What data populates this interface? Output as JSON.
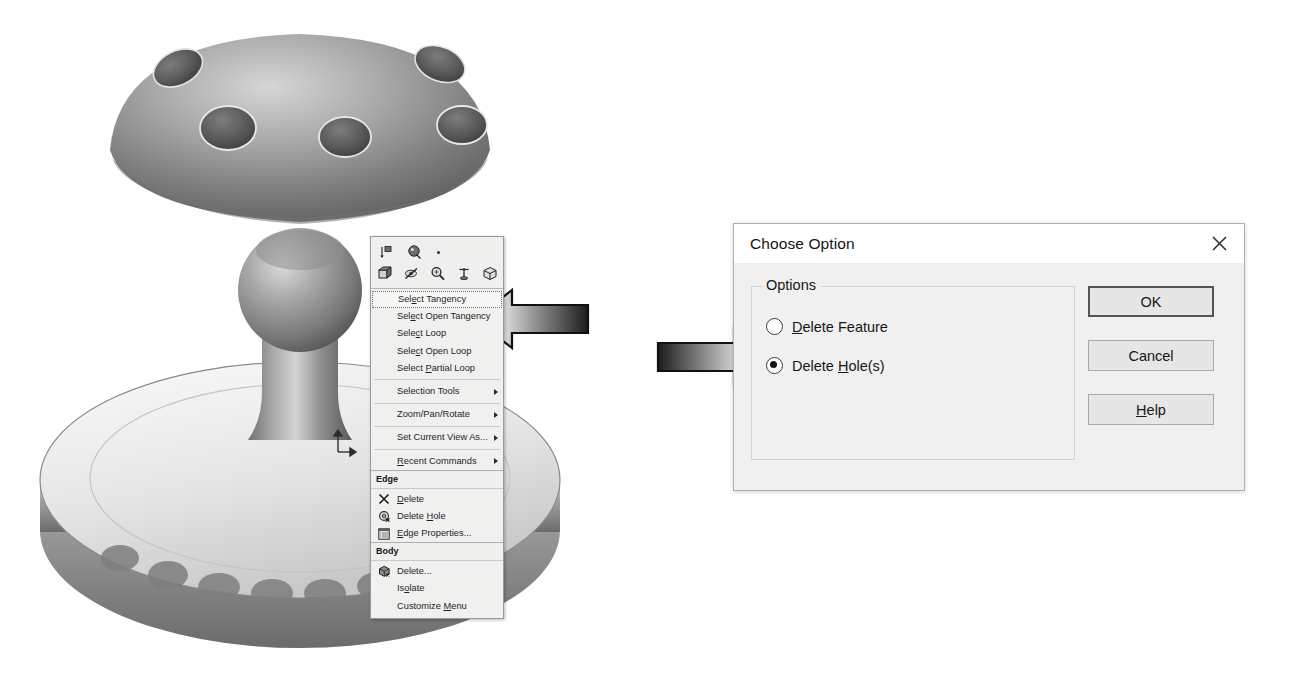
{
  "scene": {
    "description": "CAD shaded 3D model of a metal knob/stand part with circular holes on the top dome and a fluted circular base",
    "origin_marker": "coordinate-triad"
  },
  "context_menu": {
    "toolbar": {
      "row1": [
        {
          "name": "dimension-icon",
          "glyph": "dimension"
        },
        {
          "name": "smart-dimension-icon",
          "glyph": "balloon"
        },
        {
          "name": "more-dot-icon",
          "glyph": "dot"
        }
      ],
      "row2": [
        {
          "name": "face-select-icon",
          "glyph": "faces"
        },
        {
          "name": "hide-show-icon",
          "glyph": "hide"
        },
        {
          "name": "zoom-area-icon",
          "glyph": "magnifier"
        },
        {
          "name": "origin-icon",
          "glyph": "axis"
        },
        {
          "name": "isometric-view-icon",
          "glyph": "cube"
        }
      ]
    },
    "items": [
      {
        "label": "Select Tangency",
        "accel": "e",
        "highlighted": true,
        "submenu": false,
        "icon": null
      },
      {
        "label": "Select Open Tangency",
        "accel": "e",
        "highlighted": false,
        "submenu": false,
        "icon": null
      },
      {
        "label": "Select Loop",
        "accel": "c",
        "highlighted": false,
        "submenu": false,
        "icon": null
      },
      {
        "label": "Select Open Loop",
        "accel": "c",
        "highlighted": false,
        "submenu": false,
        "icon": null
      },
      {
        "label": "Select Partial Loop",
        "accel": "P",
        "highlighted": false,
        "submenu": false,
        "icon": null
      },
      {
        "separator_before": true,
        "label": "Selection Tools",
        "accel": null,
        "highlighted": false,
        "submenu": true,
        "icon": null
      },
      {
        "separator_before": true,
        "label": "Zoom/Pan/Rotate",
        "accel": null,
        "highlighted": false,
        "submenu": true,
        "icon": null
      },
      {
        "separator_before": true,
        "label": "Set Current View As...",
        "accel": null,
        "highlighted": false,
        "submenu": true,
        "icon": null
      },
      {
        "separator_before": true,
        "label": "Recent Commands",
        "accel": "R",
        "highlighted": false,
        "submenu": true,
        "icon": null
      }
    ],
    "edge_group": {
      "header": "Edge",
      "items": [
        {
          "label": "Delete",
          "accel": "D",
          "icon": "delete-x-icon"
        },
        {
          "label": "Delete Hole",
          "accel": "H",
          "icon": "delete-hole-icon"
        },
        {
          "label": "Edge Properties...",
          "accel": "E",
          "icon": "edge-properties-icon"
        }
      ]
    },
    "body_group": {
      "header": "Body",
      "items": [
        {
          "label": "Delete...",
          "accel": null,
          "icon": "delete-body-icon"
        },
        {
          "label": "Isolate",
          "accel": "o",
          "icon": null
        },
        {
          "label": "Customize Menu",
          "accel": "M",
          "icon": null
        }
      ]
    }
  },
  "dialog": {
    "title": "Choose Option",
    "close_label": "✕",
    "group_legend": "Options",
    "radios": [
      {
        "label_before": "",
        "accel": "D",
        "label_after": "elete Feature",
        "checked": false,
        "name": "delete-feature"
      },
      {
        "label_before": "Delete ",
        "accel": "H",
        "label_after": "ole(s)",
        "checked": true,
        "name": "delete-holes"
      }
    ],
    "buttons": [
      {
        "name": "ok",
        "label": "OK",
        "accel": null,
        "default": true
      },
      {
        "name": "cancel",
        "label": "Cancel",
        "accel": null,
        "default": false
      },
      {
        "name": "help",
        "label": "Help",
        "accel": "H",
        "default": false
      }
    ]
  },
  "annotations": [
    {
      "name": "arrow-to-select-tangency",
      "direction": "left",
      "target": "Select Tangency"
    },
    {
      "name": "arrow-to-delete-holes",
      "direction": "right",
      "target": "Delete Hole(s)"
    }
  ],
  "colors": {
    "menu_bg": "#f0f0ef",
    "dialog_bg": "#f0f0f0",
    "arrow_dark": "#2b2b2b",
    "arrow_light": "#ffffff",
    "model_metal": "#8d8d8d"
  }
}
